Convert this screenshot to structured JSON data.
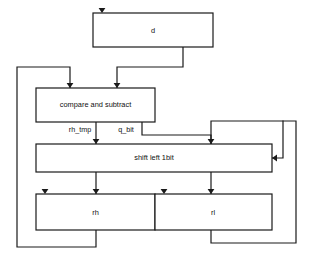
{
  "diagram": {
    "type": "block-diagram",
    "canvas": {
      "width": 309,
      "height": 268
    },
    "colors": {
      "background": "#ffffff",
      "line": "#1a1a1a",
      "box_fill": "#ffffff",
      "text": "#111111"
    },
    "blocks": [
      {
        "id": "d",
        "label": "d",
        "x": 93,
        "y": 13,
        "width": 120,
        "height": 34,
        "label_x": 153,
        "label_y": 31
      },
      {
        "id": "compare_and_subtract",
        "label": "compare and subtract",
        "x": 36,
        "y": 88,
        "width": 119,
        "height": 34,
        "label_x": 95.5,
        "label_y": 105
      },
      {
        "id": "shift_left_1bit",
        "label": "shift left 1bit",
        "x": 36,
        "y": 144,
        "width": 236,
        "height": 28,
        "label_x": 154,
        "label_y": 158
      },
      {
        "id": "rh",
        "label": "rh",
        "x": 36,
        "y": 194,
        "width": 119,
        "height": 36,
        "label_x": 95.5,
        "label_y": 213
      },
      {
        "id": "rl",
        "label": "rl",
        "x": 155,
        "y": 194,
        "width": 117,
        "height": 36,
        "label_x": 213,
        "label_y": 213
      }
    ],
    "wire_labels": [
      {
        "id": "rh_tmp",
        "text": "rh_tmp",
        "x": 80,
        "y": 130
      },
      {
        "id": "q_bit",
        "text": "q_bit",
        "x": 126,
        "y": 130
      }
    ],
    "connections": [
      {
        "id": "d-to-compare",
        "from": "d",
        "to": "compare_and_subtract",
        "path": "M183,47 L183,67 L117,67 L117,88"
      },
      {
        "id": "rh-feedback-to-compare",
        "from": "rh",
        "to": "compare_and_subtract",
        "path": "M96,230 L96,247 L17,247 L17,67 L70,67 L70,88"
      },
      {
        "id": "rh_tmp-to-shift",
        "from": "compare_and_subtract",
        "to": "shift_left_1bit",
        "path": "M96,122 L96,144"
      },
      {
        "id": "q_bit-to-shift",
        "from": "compare_and_subtract",
        "to": "shift_left_1bit",
        "path": "M142,122 L142,135 L211,135 L211,144"
      },
      {
        "id": "rl-feedback-to-shift-top",
        "from": "rl",
        "to": "shift_left_1bit",
        "path": "M211,230 L211,243 L296,243 L296,121 L211,121 L211,144"
      },
      {
        "id": "shift-right-side-loop",
        "from": "shift_left_1bit",
        "to": "shift_left_1bit",
        "path": "M283,121 L283,158 L272,158"
      },
      {
        "id": "shift-to-rh",
        "from": "shift_left_1bit",
        "to": "rh",
        "path": "M96,172 L96,194"
      },
      {
        "id": "shift-to-rl",
        "from": "shift_left_1bit",
        "to": "rl",
        "path": "M211,172 L211,194"
      }
    ],
    "arrowheads": [
      {
        "id": "arrow-into-d",
        "x": 102,
        "y": 13,
        "direction": "down"
      },
      {
        "id": "arrow-into-compare-left",
        "x": 70,
        "y": 88,
        "direction": "down"
      },
      {
        "id": "arrow-into-compare-right",
        "x": 117,
        "y": 88,
        "direction": "down"
      },
      {
        "id": "arrow-into-shift-left",
        "x": 96,
        "y": 144,
        "direction": "down"
      },
      {
        "id": "arrow-into-shift-right",
        "x": 211,
        "y": 144,
        "direction": "down"
      },
      {
        "id": "arrow-into-shift-side",
        "x": 272,
        "y": 158,
        "direction": "left"
      },
      {
        "id": "arrow-into-rh",
        "x": 96,
        "y": 194,
        "direction": "down"
      },
      {
        "id": "arrow-into-rl",
        "x": 211,
        "y": 194,
        "direction": "down"
      },
      {
        "id": "arrow-marker-rh-corner",
        "x": 45,
        "y": 194,
        "direction": "down"
      },
      {
        "id": "arrow-marker-rl-corner",
        "x": 164,
        "y": 194,
        "direction": "down"
      }
    ]
  }
}
